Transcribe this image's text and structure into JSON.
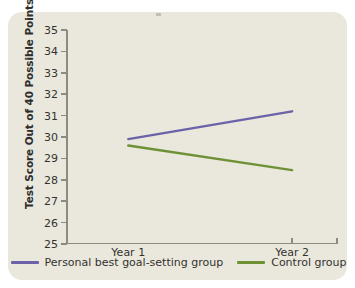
{
  "chart_data": {
    "type": "line",
    "title": "",
    "xlabel": "",
    "ylabel": "Test Score Out of 40 Possible Points",
    "categories": [
      "Year 1",
      "Year 2"
    ],
    "x": [
      1,
      2
    ],
    "xlim": [
      0.62,
      2.28
    ],
    "ylim": [
      25,
      35
    ],
    "ytick_labels": [
      "35",
      "34",
      "33",
      "32",
      "31",
      "30",
      "29",
      "28",
      "27",
      "26",
      "25"
    ],
    "yticks": [
      35,
      34,
      33,
      32,
      31,
      30,
      29,
      28,
      27,
      26,
      25
    ],
    "grid": false,
    "legend_position": "bottom-center",
    "series": [
      {
        "name": "Personal best goal-setting group",
        "color": "#6b62a8",
        "values": [
          29.9,
          31.2
        ]
      },
      {
        "name": "Control group",
        "color": "#6e9136",
        "values": [
          29.6,
          28.45
        ]
      }
    ]
  },
  "legend": {
    "entries": [
      {
        "label": "Personal best goal-setting group",
        "color": "#6b62a8"
      },
      {
        "label": "Control group",
        "color": "#6e9136"
      }
    ]
  },
  "colors": {
    "panel_background": "#eae8dd",
    "page_background": "#ffffff",
    "axis": "#8c8b80",
    "text": "#33332e",
    "series_personal_best": "#6b62a8",
    "series_control": "#6e9136"
  }
}
